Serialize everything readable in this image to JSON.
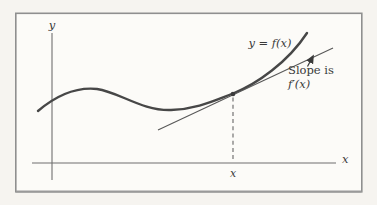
{
  "figure": {
    "type": "function-graph-with-tangent-line",
    "labels": {
      "y_axis": "y",
      "x_axis": "x",
      "curve": "y = f(x)",
      "slope_caption_line1": "Slope is",
      "slope_caption_line2": "f′(x)",
      "tangency_x_tick": "x"
    },
    "colors": {
      "page_background": "#f6f4f0",
      "frame_fill": "#fcfbf8",
      "frame_border": "#8f8f8f",
      "axis": "#6f6f6f",
      "curve": "#474747",
      "tangent_line": "#585858",
      "dashed_guide": "#666666",
      "text": "#3a3a3a"
    },
    "geometry": {
      "curve_path": "M 38 111 C 58 94 78 87 97 89 C 119 92 142 111 171 110 C 197 109 213 101 233 93.5 C 257 84 288 62 307 33",
      "tangent_path": "M 158 130 L 333 48",
      "dashed_guide_path": "M 233 97.5 L 233 161",
      "arrow_path": "M 307.5 66.5 L 312.8 56.5",
      "y_axis_path": "M 52 33 L 52 180",
      "x_axis_path": "M 32 163 L 336 163",
      "tangency_point": {
        "x": 233,
        "y": 94
      }
    }
  }
}
